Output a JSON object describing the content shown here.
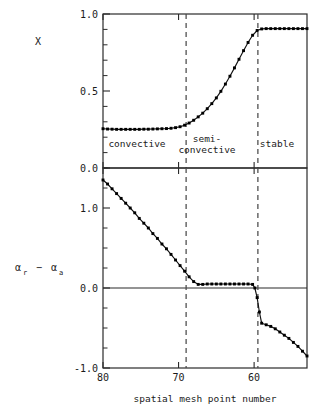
{
  "figure": {
    "xlabel": "spatial mesh point number",
    "upper_ylabel": "X",
    "lower_ylabel_main_1": "α",
    "lower_ylabel_sub_1": "r",
    "lower_ylabel_minus": "−",
    "lower_ylabel_main_2": "α",
    "lower_ylabel_sub_2": "a",
    "region_labels": {
      "convective": "convective",
      "semi_line1": "semi-",
      "semi_line2": "convective",
      "stable": "stable"
    },
    "colors": {
      "axis": "#2b2b2b",
      "curve": "#111111",
      "marker": "#000000",
      "divider": "#4a4a4a",
      "background": "#ffffff"
    }
  },
  "chart_data": [
    {
      "type": "line",
      "panel": "upper",
      "title": "",
      "xlabel": "spatial mesh point number",
      "ylabel": "X",
      "xlim": [
        80,
        53
      ],
      "ylim": [
        0.0,
        1.0
      ],
      "x_reversed": true,
      "grid": false,
      "legend": null,
      "yticks": [
        0.0,
        0.5,
        1.0
      ],
      "ytick_labels": [
        "0.0",
        "0.5",
        "1.0"
      ],
      "yminor_step": 0.1,
      "xticks": [
        80,
        70,
        60
      ],
      "xtick_labels": [
        "80",
        "70",
        "60"
      ],
      "markers": "filled-square",
      "annotations": [
        {
          "text": "convective",
          "x_center": 75.0,
          "y": 0.14
        },
        {
          "text": "semi-convective",
          "x_center": 65.0,
          "y": 0.14
        },
        {
          "text": "stable",
          "x_center": 57.0,
          "y": 0.14
        }
      ],
      "vlines": [
        69.0,
        59.5
      ],
      "x": [
        80.0,
        79.4,
        78.8,
        78.2,
        77.6,
        77.0,
        76.4,
        75.8,
        75.2,
        74.6,
        74.0,
        73.4,
        72.8,
        72.2,
        71.6,
        71.0,
        70.4,
        69.8,
        69.2,
        68.6,
        68.0,
        67.4,
        66.8,
        66.2,
        65.6,
        65.0,
        64.4,
        63.8,
        63.2,
        62.6,
        62.0,
        61.4,
        60.8,
        60.2,
        59.6,
        59.0,
        58.4,
        57.8,
        57.2,
        56.6,
        56.0,
        55.4,
        54.8,
        54.2,
        53.6,
        53.0
      ],
      "values": [
        0.255,
        0.253,
        0.252,
        0.251,
        0.251,
        0.251,
        0.251,
        0.251,
        0.251,
        0.252,
        0.252,
        0.253,
        0.254,
        0.255,
        0.256,
        0.258,
        0.262,
        0.268,
        0.278,
        0.292,
        0.31,
        0.332,
        0.356,
        0.385,
        0.418,
        0.455,
        0.498,
        0.545,
        0.596,
        0.65,
        0.706,
        0.762,
        0.815,
        0.862,
        0.893,
        0.903,
        0.905,
        0.905,
        0.905,
        0.905,
        0.905,
        0.905,
        0.905,
        0.905,
        0.905,
        0.905
      ]
    },
    {
      "type": "line",
      "panel": "lower",
      "title": "",
      "xlabel": "spatial mesh point number",
      "ylabel": "alpha_r - alpha_a",
      "xlim": [
        80,
        53
      ],
      "ylim": [
        -1.0,
        1.5
      ],
      "x_reversed": true,
      "grid": false,
      "legend": null,
      "yticks": [
        -1.0,
        0.0,
        1.0
      ],
      "ytick_labels": [
        "-1.0",
        "0.0",
        "1.0"
      ],
      "yminor_step": 0.25,
      "xticks": [
        80,
        70,
        60
      ],
      "xtick_labels": [
        "80",
        "70",
        "60"
      ],
      "markers": "filled-square",
      "vlines": [
        69.0,
        59.5
      ],
      "zero_line": 0.0,
      "x": [
        80.0,
        79.4,
        78.8,
        78.2,
        77.6,
        77.0,
        76.4,
        75.8,
        75.2,
        74.6,
        74.0,
        73.4,
        72.8,
        72.2,
        71.6,
        71.0,
        70.4,
        69.8,
        69.2,
        68.6,
        68.0,
        67.4,
        66.8,
        66.2,
        65.6,
        65.0,
        64.4,
        63.8,
        63.2,
        62.6,
        62.0,
        61.4,
        60.8,
        60.2,
        59.9,
        59.6,
        59.3,
        59.0,
        58.4,
        57.8,
        57.2,
        56.6,
        56.0,
        55.4,
        54.8,
        54.2,
        53.6,
        53.0
      ],
      "values": [
        1.35,
        1.3,
        1.24,
        1.18,
        1.12,
        1.06,
        1.0,
        0.94,
        0.87,
        0.81,
        0.75,
        0.68,
        0.62,
        0.55,
        0.49,
        0.42,
        0.35,
        0.28,
        0.21,
        0.14,
        0.08,
        0.045,
        0.045,
        0.05,
        0.05,
        0.05,
        0.05,
        0.05,
        0.05,
        0.05,
        0.05,
        0.05,
        0.05,
        0.045,
        0.0,
        -0.12,
        -0.3,
        -0.44,
        -0.46,
        -0.48,
        -0.51,
        -0.55,
        -0.59,
        -0.63,
        -0.68,
        -0.73,
        -0.79,
        -0.85
      ]
    }
  ]
}
